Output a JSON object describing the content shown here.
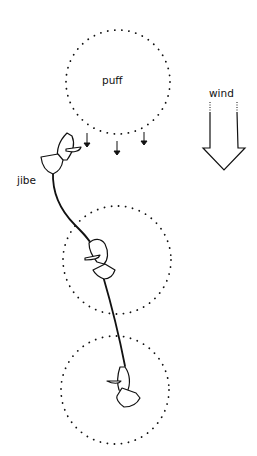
{
  "labels": {
    "puff": "puff",
    "wind": "wind",
    "jibe": "jibe"
  },
  "colors": {
    "ink": "#111111",
    "background": "#ffffff"
  },
  "puffs": [
    {
      "id": "puff-top",
      "cx": 118,
      "cy": 82,
      "r": 52
    },
    {
      "id": "puff-middle",
      "cx": 117,
      "cy": 260,
      "r": 54
    },
    {
      "id": "puff-bottom",
      "cx": 115,
      "cy": 390,
      "r": 54
    }
  ],
  "icons": {
    "wind_arrow": "wind-arrow-icon",
    "gust_arrows": "gust-arrow-icon",
    "boat": "sailboat-icon"
  }
}
